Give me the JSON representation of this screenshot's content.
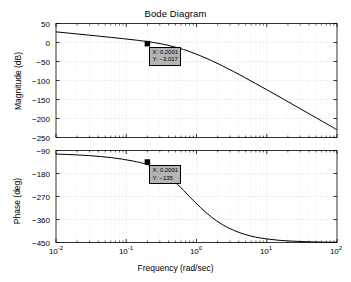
{
  "chart_data": {
    "type": "line",
    "title": "Bode Diagram",
    "xlabel": "Frequency (rad/sec)",
    "xscale": "log",
    "xlim": [
      0.01,
      100
    ],
    "xticks": [
      "10^-2",
      "10^-1",
      "10^0",
      "10^1",
      "10^2"
    ],
    "xtick_labels": [
      "10",
      "10",
      "10",
      "10",
      "10"
    ],
    "xtick_exponents": [
      "-2",
      "-1",
      "0",
      "1",
      "2"
    ],
    "grid": true,
    "legend": "none",
    "subplots": [
      {
        "name": "magnitude",
        "ylabel": "Magnitude (dB)",
        "ylim": [
          -250,
          50
        ],
        "yticks": [
          50,
          0,
          -50,
          -100,
          -150,
          -200,
          -250
        ],
        "ytick_labels": [
          "50",
          "0",
          "−50",
          "−100",
          "−150",
          "−200",
          "−250"
        ],
        "series": [
          {
            "name": "magnitude-response",
            "color": "#000000",
            "x": [
              0.01,
              0.0144,
              0.0207,
              0.0298,
              0.0428,
              0.0616,
              0.0886,
              0.1274,
              0.1833,
              0.2001,
              0.2637,
              0.3793,
              0.5456,
              0.7848,
              1.129,
              1.624,
              2.336,
              3.36,
              4.833,
              6.952,
              10.0,
              14.38,
              20.69,
              29.76,
              42.81,
              61.58,
              88.59,
              100.0
            ],
            "y": [
              28.0,
              25.1,
              22.2,
              19.3,
              16.3,
              13.3,
              10.2,
              7.0,
              3.5,
              2.4,
              -1.0,
              -6.6,
              -14.0,
              -23.4,
              -34.6,
              -47.4,
              -61.4,
              -76.3,
              -91.9,
              -107.9,
              -124.2,
              -140.7,
              -157.3,
              -173.9,
              -190.6,
              -207.3,
              -224.0,
              -230.0
            ]
          }
        ],
        "datatip": {
          "x_label": "X: 0.2001",
          "y_label": "Y: −3.017",
          "x_value": 0.2001,
          "y_value": -3.017
        }
      },
      {
        "name": "phase",
        "ylabel": "Phase (deg)",
        "ylim": [
          -450,
          -90
        ],
        "yticks": [
          -90,
          -180,
          -270,
          -360,
          -450
        ],
        "ytick_labels": [
          "−90",
          "−180",
          "−270",
          "−360",
          "−450"
        ],
        "series": [
          {
            "name": "phase-response",
            "color": "#000000",
            "x": [
              0.01,
              0.0144,
              0.0207,
              0.0298,
              0.0428,
              0.0616,
              0.0886,
              0.1274,
              0.1833,
              0.2001,
              0.2637,
              0.3793,
              0.5456,
              0.7848,
              1.129,
              1.624,
              2.336,
              3.36,
              4.833,
              6.952,
              10.0,
              14.38,
              20.69,
              29.76,
              42.81,
              61.58,
              88.59,
              100.0
            ],
            "y": [
              -104.0,
              -105.5,
              -107.5,
              -110.0,
              -113.5,
              -118.0,
              -124.0,
              -131.5,
              -141.5,
              -145.0,
              -160.0,
              -186.0,
              -224.0,
              -269.0,
              -312.0,
              -350.0,
              -380.0,
              -402.0,
              -418.0,
              -429.0,
              -436.0,
              -441.0,
              -444.0,
              -446.0,
              -447.5,
              -448.5,
              -449.0,
              -449.2
            ]
          }
        ],
        "datatip": {
          "x_label": "X: 0.2001",
          "y_label": "Y: −135",
          "x_value": 0.2001,
          "y_value": -135
        }
      }
    ]
  }
}
